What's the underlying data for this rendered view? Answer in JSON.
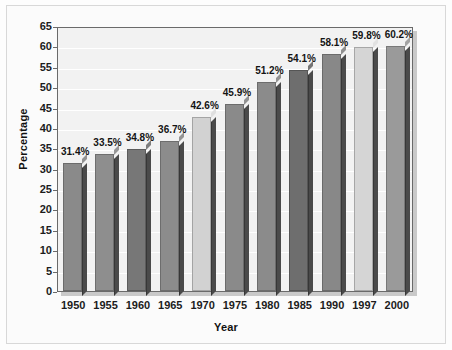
{
  "chart_data": {
    "type": "bar",
    "title": "",
    "xlabel": "Year",
    "ylabel": "Percentage",
    "categories": [
      "1950",
      "1955",
      "1960",
      "1965",
      "1970",
      "1975",
      "1980",
      "1985",
      "1990",
      "1997",
      "2000"
    ],
    "values": [
      31.4,
      33.5,
      34.8,
      36.7,
      42.6,
      45.9,
      51.2,
      54.1,
      58.1,
      59.8,
      60.2
    ],
    "data_labels": [
      "31.4%",
      "33.5%",
      "34.8%",
      "36.7%",
      "42.6%",
      "45.9%",
      "51.2%",
      "54.1%",
      "58.1%",
      "59.8%",
      "60.2%"
    ],
    "bar_colors": [
      "#8a8a8a",
      "#8e8e8e",
      "#777777",
      "#8c8c8c",
      "#d2d2d2",
      "#8a8a8a",
      "#8b8b8b",
      "#6e6e6e",
      "#888888",
      "#d5d5d5",
      "#9a9a9a"
    ],
    "ylim": [
      0,
      65
    ],
    "ytick_labels": [
      "0",
      "5",
      "10",
      "15",
      "20",
      "25",
      "30",
      "35",
      "40",
      "45",
      "50",
      "55",
      "60",
      "65"
    ],
    "ytick_values": [
      0,
      5,
      10,
      15,
      20,
      25,
      30,
      35,
      40,
      45,
      50,
      55,
      60,
      65
    ],
    "grid": true,
    "legend": "none",
    "plot_background": "#f2f2f2",
    "axis_color": "#6a6a6a"
  }
}
